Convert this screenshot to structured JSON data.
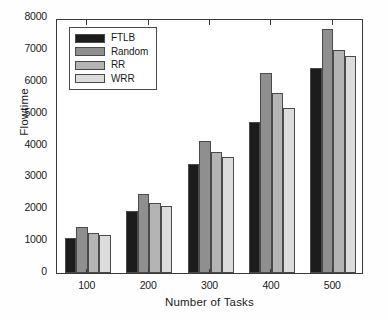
{
  "chart_data": {
    "type": "bar",
    "title": "",
    "xlabel": "Number of Tasks",
    "ylabel": "Flowtime",
    "categories": [
      "100",
      "200",
      "300",
      "400",
      "500"
    ],
    "series": [
      {
        "name": "FTLB",
        "color": "#1c1c1c",
        "values": [
          1100,
          1930,
          3430,
          4730,
          6430
        ]
      },
      {
        "name": "Random",
        "color": "#8f8f8f",
        "values": [
          1430,
          2470,
          4130,
          6290,
          7650
        ]
      },
      {
        "name": "RR",
        "color": "#b4b4b4",
        "values": [
          1260,
          2200,
          3800,
          5640,
          7000
        ]
      },
      {
        "name": "WRR",
        "color": "#dcdcdc",
        "values": [
          1200,
          2100,
          3630,
          5180,
          6800
        ]
      }
    ],
    "ylim": [
      0,
      8000
    ],
    "yticks": [
      0,
      1000,
      2000,
      3000,
      4000,
      5000,
      6000,
      7000,
      8000
    ],
    "ytick_labels": [
      "0",
      "1000",
      "2000",
      "3000",
      "4000",
      "5000",
      "6000",
      "7000",
      "8000"
    ],
    "grid": false,
    "legend_position": "upper left",
    "axis_color": "#3a3a3a",
    "background": "#ffffff"
  }
}
